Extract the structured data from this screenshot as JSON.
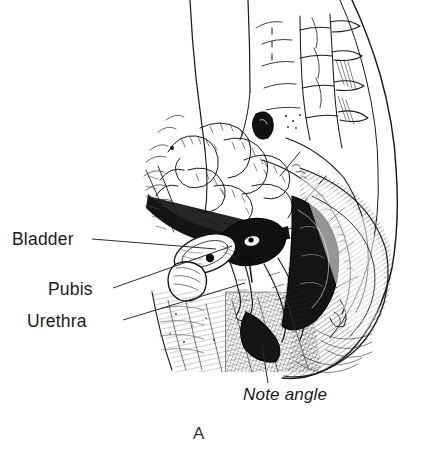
{
  "figure": {
    "kind": "medical-line-illustration",
    "panel_label": "A",
    "background_color": "#ffffff",
    "ink_color": "#1a1a1a",
    "width": 425,
    "height": 457
  },
  "labels": {
    "bladder": "Bladder",
    "pubis": "Pubis",
    "urethra": "Urethra",
    "note_angle": "Note angle",
    "panel": "A"
  },
  "leader_lines": [
    {
      "name": "bladder-leader",
      "from": [
        92,
        239
      ],
      "to": [
        216,
        249
      ]
    },
    {
      "name": "pubis-leader",
      "from": [
        113,
        288
      ],
      "to": [
        232,
        246
      ]
    },
    {
      "name": "urethra-leader",
      "from": [
        123,
        320
      ],
      "to": [
        245,
        283
      ]
    },
    {
      "name": "note-angle-leader",
      "from": [
        268,
        383
      ],
      "to": [
        262,
        345
      ]
    }
  ],
  "anatomy": [
    {
      "name": "abdominal-wall-contour"
    },
    {
      "name": "lumbar-spine-vertebrae"
    },
    {
      "name": "sacrum"
    },
    {
      "name": "coccyx"
    },
    {
      "name": "small-intestine-loops"
    },
    {
      "name": "uterus"
    },
    {
      "name": "bladder"
    },
    {
      "name": "pubis-symphysis"
    },
    {
      "name": "urethra"
    },
    {
      "name": "vagina"
    },
    {
      "name": "rectum"
    },
    {
      "name": "buttock-contour"
    },
    {
      "name": "thigh-hatching"
    },
    {
      "name": "urethrovesical-angle-arrow"
    }
  ]
}
